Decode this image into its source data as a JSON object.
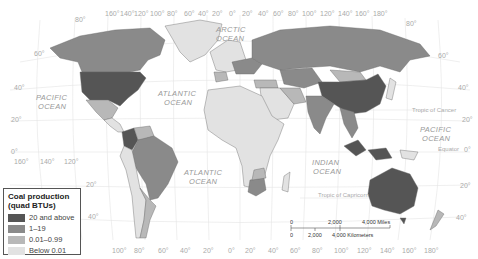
{
  "map": {
    "title": "World coal production",
    "top_longitude_labels": [
      "160°",
      "140°",
      "120°",
      "100°",
      "80°",
      "60°",
      "40°",
      "20°",
      "0°",
      "20°",
      "40°",
      "60°",
      "80°",
      "100°",
      "120°",
      "140°",
      "160°",
      "180°"
    ],
    "bottom_longitude_labels": [
      "160°",
      "140°",
      "120°",
      "100°",
      "80°",
      "60°",
      "40°",
      "20°",
      "0°",
      "20°",
      "40°",
      "60°",
      "80°",
      "100°",
      "120°",
      "140°",
      "160°",
      "180°"
    ],
    "left_latitude_labels": [
      "80°",
      "60°",
      "40°",
      "20°",
      "0°",
      "20°",
      "40°"
    ],
    "right_latitude_labels": [
      "80°",
      "60°",
      "40°",
      "20°",
      "0°",
      "20°",
      "40°"
    ],
    "ocean_labels": {
      "arctic": [
        "ARCTIC",
        "OCEAN"
      ],
      "pacific_west": [
        "PACIFIC",
        "OCEAN"
      ],
      "atlantic_north": [
        "ATLANTIC",
        "OCEAN"
      ],
      "atlantic_south": [
        "ATLANTIC",
        "OCEAN"
      ],
      "indian": [
        "INDIAN",
        "OCEAN"
      ],
      "pacific_east": [
        "PACIFIC",
        "OCEAN"
      ]
    },
    "reference_lines": {
      "tropic_of_cancer": "Tropic of Cancer",
      "equator": "Equator",
      "tropic_of_capricorn": "Tropic of Capricorn"
    }
  },
  "legend": {
    "title_line1": "Coal production",
    "title_line2": "(quad BTUs)",
    "items": [
      {
        "label": "20 and above",
        "color": "#555555"
      },
      {
        "label": "1–19",
        "color": "#8a8a8a"
      },
      {
        "label": "0.01–0.99",
        "color": "#b8b8b8"
      },
      {
        "label": "Below 0.01",
        "color": "#e2e2e2"
      }
    ]
  },
  "scale_bar": {
    "miles": [
      "0",
      "2,000",
      "4,000 Miles"
    ],
    "kilometers": [
      "0",
      "2,000",
      "4,000 Kilometers"
    ]
  },
  "regions": {
    "20_and_above": [
      "United States",
      "China",
      "Australia",
      "South Africa (partly)",
      "Colombia",
      "Indonesia",
      "India"
    ],
    "1_19": [
      "Canada",
      "Russia",
      "Kazakhstan",
      "Poland",
      "Ukraine",
      "South Africa",
      "Vietnam",
      "Germany",
      "Brazil"
    ],
    "0_01_0_99": [
      "Mexico",
      "Mongolia",
      "Venezuela",
      "Spain",
      "Iran",
      "Turkey",
      "Argentina",
      "New Zealand"
    ],
    "below_0_01": [
      "Greenland",
      "Most of Africa",
      "Middle East",
      "Peru",
      "Chile"
    ]
  }
}
